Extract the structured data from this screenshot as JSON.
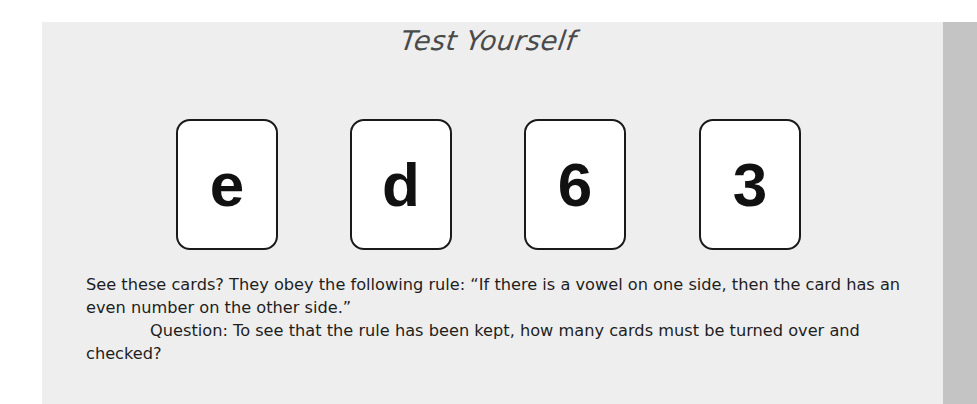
{
  "box": {
    "title": "Test Yourself",
    "cards": [
      {
        "face": "e"
      },
      {
        "face": "d"
      },
      {
        "face": "6"
      },
      {
        "face": "3"
      }
    ],
    "paragraphs": [
      "See these cards? They obey the following rule: “If there is a vowel on one side, then the card has an even number on the other side.”",
      "Question: To see that the rule has been kept, how many cards must be turned over and checked?"
    ]
  },
  "colors": {
    "panel_bg": "#eeeeee",
    "side_strip": "#c4c4c4",
    "card_border": "#1a1a1a"
  }
}
